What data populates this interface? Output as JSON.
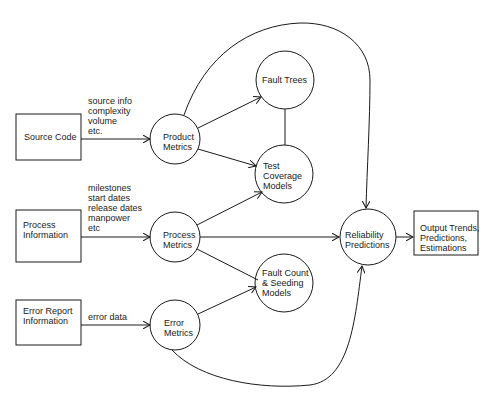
{
  "diagram": {
    "inputs": [
      {
        "id": "source-code",
        "label": "Source Code",
        "annotation": "source info\ncomplexity\nvolume\netc."
      },
      {
        "id": "process-information",
        "label": "Process\nInformation",
        "annotation": "milestones\nstart dates\nrelease dates\nmanpower\netc"
      },
      {
        "id": "error-report-information",
        "label": "Error Report\nInformation",
        "annotation": "error data"
      }
    ],
    "metrics": [
      {
        "id": "product-metrics",
        "label": "Product\nMetrics"
      },
      {
        "id": "process-metrics",
        "label": "Process\nMetrics"
      },
      {
        "id": "error-metrics",
        "label": "Error\nMetrics"
      }
    ],
    "models": [
      {
        "id": "fault-trees",
        "label": "Fault Trees"
      },
      {
        "id": "test-coverage-models",
        "label": "Test\nCoverage\nModels"
      },
      {
        "id": "fault-count-seeding-models",
        "label": "Fault Count\n& Seeding\nModels"
      }
    ],
    "predictions": {
      "id": "reliability-predictions",
      "label": "Reliability\nPredictions"
    },
    "output": {
      "id": "output",
      "label": "Output Trends,\nPredictions,\nEstimations"
    },
    "colors": {
      "stroke": "#1a1a1a",
      "background": "#ffffff"
    }
  }
}
